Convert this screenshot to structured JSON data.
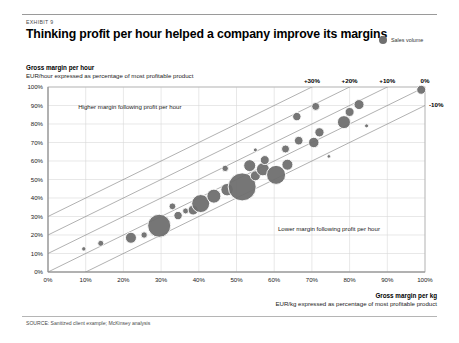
{
  "header": {
    "exhibit_label": "EXHIBIT 9",
    "headline": "Thinking profit per hour helped a company improve its margins"
  },
  "legend": {
    "items": [
      {
        "label": "Sales volume",
        "color": "#6f6f6f",
        "marker": "circle"
      }
    ]
  },
  "source": "SOURCE: Sanitized client example; McKinsey analysis",
  "chart_data": {
    "type": "scatter",
    "title": "Thinking profit per hour helped a company improve its margins",
    "subtitle": "EXHIBIT 9",
    "ylabel": "Gross margin per hour",
    "ylabel_sub": "EUR/hour expressed as percentage of most profitable product",
    "xlabel": "Gross margin per kg",
    "xlabel_sub": "EUR/kg expressed as percentage of most profitable product",
    "xlim": [
      0,
      100
    ],
    "ylim": [
      0,
      100
    ],
    "xticks": [
      "0%",
      "10%",
      "20%",
      "30%",
      "40%",
      "50%",
      "60%",
      "70%",
      "80%",
      "90%",
      "100%"
    ],
    "yticks": [
      "0%",
      "10%",
      "20%",
      "30%",
      "40%",
      "50%",
      "60%",
      "70%",
      "80%",
      "90%",
      "100%"
    ],
    "grid": true,
    "legend_position": "top-right",
    "bubble_color": "#6f6f6f",
    "bubble_outline": "#ffffff",
    "size_encoding": "Sales volume",
    "reference_lines": [
      {
        "label": "+30%",
        "intercept": 30,
        "slope": 1
      },
      {
        "label": "+20%",
        "intercept": 20,
        "slope": 1
      },
      {
        "label": "+10%",
        "intercept": 10,
        "slope": 1
      },
      {
        "label": "0%",
        "intercept": 0,
        "slope": 1
      },
      {
        "label": "-10%",
        "intercept": -10,
        "slope": 1
      }
    ],
    "annotations": [
      {
        "text": "Higher margin following profit per hour",
        "x": 8,
        "y": 88
      },
      {
        "text": "Lower margin following profit per hour",
        "x": 61,
        "y": 22
      }
    ],
    "points": [
      {
        "x": 9.5,
        "y": 12.5,
        "size": 2.2
      },
      {
        "x": 14.0,
        "y": 15.5,
        "size": 3.0
      },
      {
        "x": 22.0,
        "y": 18.5,
        "size": 5.5
      },
      {
        "x": 25.5,
        "y": 20.0,
        "size": 3.2
      },
      {
        "x": 29.5,
        "y": 25.0,
        "size": 11.5
      },
      {
        "x": 34.5,
        "y": 30.5,
        "size": 4.2
      },
      {
        "x": 36.5,
        "y": 33.0,
        "size": 3.0
      },
      {
        "x": 33.0,
        "y": 35.5,
        "size": 3.4
      },
      {
        "x": 38.5,
        "y": 33.5,
        "size": 5.0
      },
      {
        "x": 40.5,
        "y": 37.0,
        "size": 9.0
      },
      {
        "x": 44.0,
        "y": 41.0,
        "size": 7.0
      },
      {
        "x": 47.5,
        "y": 44.5,
        "size": 6.2
      },
      {
        "x": 51.5,
        "y": 46.0,
        "size": 14.0
      },
      {
        "x": 55.0,
        "y": 52.0,
        "size": 5.0
      },
      {
        "x": 57.0,
        "y": 55.5,
        "size": 6.5
      },
      {
        "x": 53.5,
        "y": 57.5,
        "size": 6.0
      },
      {
        "x": 57.5,
        "y": 60.5,
        "size": 4.5
      },
      {
        "x": 60.5,
        "y": 52.5,
        "size": 9.5
      },
      {
        "x": 63.5,
        "y": 58.0,
        "size": 5.5
      },
      {
        "x": 47.0,
        "y": 56.0,
        "size": 3.2
      },
      {
        "x": 55.0,
        "y": 66.0,
        "size": 2.0
      },
      {
        "x": 63.0,
        "y": 66.5,
        "size": 4.0
      },
      {
        "x": 66.5,
        "y": 71.0,
        "size": 4.3
      },
      {
        "x": 70.5,
        "y": 70.0,
        "size": 5.2
      },
      {
        "x": 72.0,
        "y": 75.5,
        "size": 4.6
      },
      {
        "x": 66.0,
        "y": 84.0,
        "size": 4.2
      },
      {
        "x": 71.0,
        "y": 89.5,
        "size": 4.0
      },
      {
        "x": 74.5,
        "y": 62.5,
        "size": 1.8
      },
      {
        "x": 78.5,
        "y": 81.0,
        "size": 6.5
      },
      {
        "x": 80.0,
        "y": 86.5,
        "size": 4.5
      },
      {
        "x": 82.5,
        "y": 90.5,
        "size": 5.0
      },
      {
        "x": 84.5,
        "y": 79.0,
        "size": 2.0
      },
      {
        "x": 99.0,
        "y": 98.5,
        "size": 4.5
      }
    ]
  }
}
